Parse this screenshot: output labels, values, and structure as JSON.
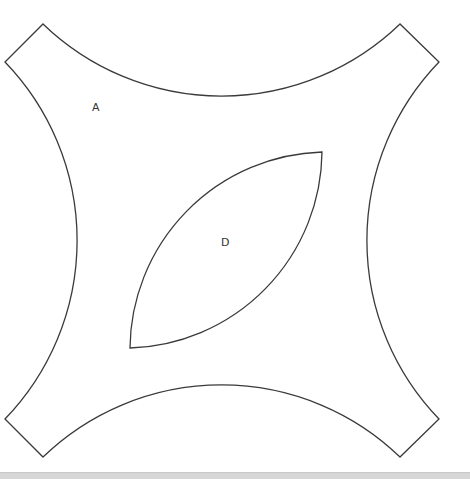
{
  "diagram": {
    "regions": [
      {
        "id": "outer",
        "label": "A",
        "label_pos": [
          96,
          111
        ]
      },
      {
        "id": "inner",
        "label": "D",
        "label_pos": [
          225,
          246
        ]
      }
    ],
    "stroke_color": "#3a3a3a",
    "background": "#ffffff",
    "bottom_bar_color": "#d6d6d6"
  }
}
